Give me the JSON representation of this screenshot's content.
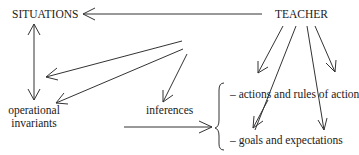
{
  "diagram": {
    "nodes": {
      "situations": "SITUATIONS",
      "teacher": "TEACHER",
      "operational_invariants_line1": "operational",
      "operational_invariants_line2": "invariants",
      "inferences": "inferences",
      "actions": "– actions and rules of action",
      "goals": "– goals and expectations"
    },
    "edges": [
      {
        "from": "teacher",
        "to": "situations"
      },
      {
        "from": "situations",
        "to": "operational invariants",
        "bidirectional": true
      },
      {
        "from": "teacher",
        "to": "situations-region"
      },
      {
        "from": "teacher",
        "to": "operational invariants"
      },
      {
        "from": "teacher",
        "to": "inferences"
      },
      {
        "from": "teacher",
        "to": "actions and rules of action"
      },
      {
        "from": "teacher",
        "to": "goals and expectations"
      },
      {
        "from": "operational invariants",
        "to": "actions/goals group"
      }
    ]
  }
}
